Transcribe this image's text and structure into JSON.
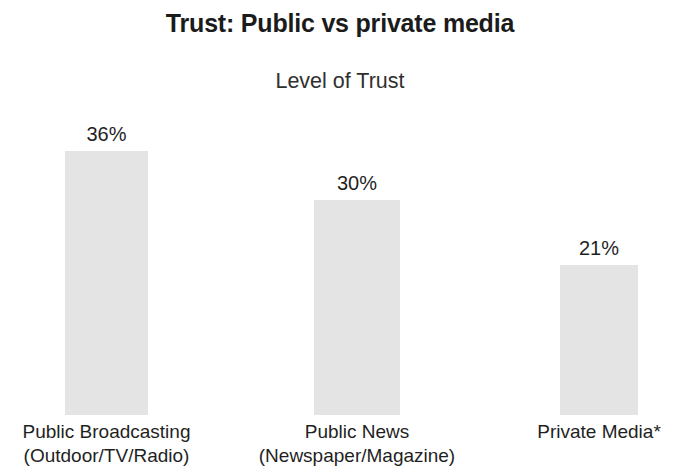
{
  "chart_data": {
    "type": "bar",
    "title": "Trust: Public vs private media",
    "subtitle": "Level of Trust",
    "xlabel": "",
    "ylabel": "",
    "ylim": [
      0,
      40
    ],
    "grid": false,
    "legend": false,
    "bar_color": "#dedede",
    "text_color": "#1f1f1f",
    "categories": [
      "Public Broadcasting (Outdoor/TV/Radio)",
      "Public News (Newspaper/Magazine)",
      "Private Media*"
    ],
    "values": [
      36,
      30,
      21
    ],
    "value_labels": [
      "36%",
      "30%",
      "21%"
    ],
    "bars": [
      {
        "value": 36,
        "value_label": "36%",
        "label_line1": "Public Broadcasting",
        "label_line2": "(Outdoor/TV/Radio)",
        "left_px": 65,
        "width_px": 83,
        "height_px": 264
      },
      {
        "value": 30,
        "value_label": "30%",
        "label_line1": "Public News",
        "label_line2": "(Newspaper/Magazine)",
        "left_px": 314,
        "width_px": 86,
        "height_px": 215
      },
      {
        "value": 21,
        "value_label": "21%",
        "label_line1": "Private Media*",
        "label_line2": "",
        "left_px": 560,
        "width_px": 78,
        "height_px": 150
      }
    ]
  }
}
